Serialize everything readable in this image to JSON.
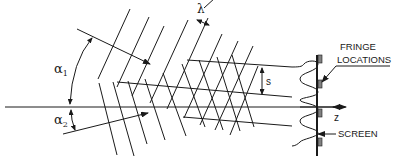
{
  "diagram": {
    "labels": {
      "alpha1": "α",
      "alpha1_sub": "1",
      "alpha2": "α",
      "alpha2_sub": "2",
      "lambda": "λ",
      "spacing": "s",
      "z_axis": "z",
      "fringe_line1": "FRINGE",
      "fringe_line2": "LOCATIONS",
      "screen": "SCREEN"
    },
    "colors": {
      "stroke": "#1a1a1a",
      "background": "#ffffff",
      "fringe_marker": "#808080"
    }
  }
}
